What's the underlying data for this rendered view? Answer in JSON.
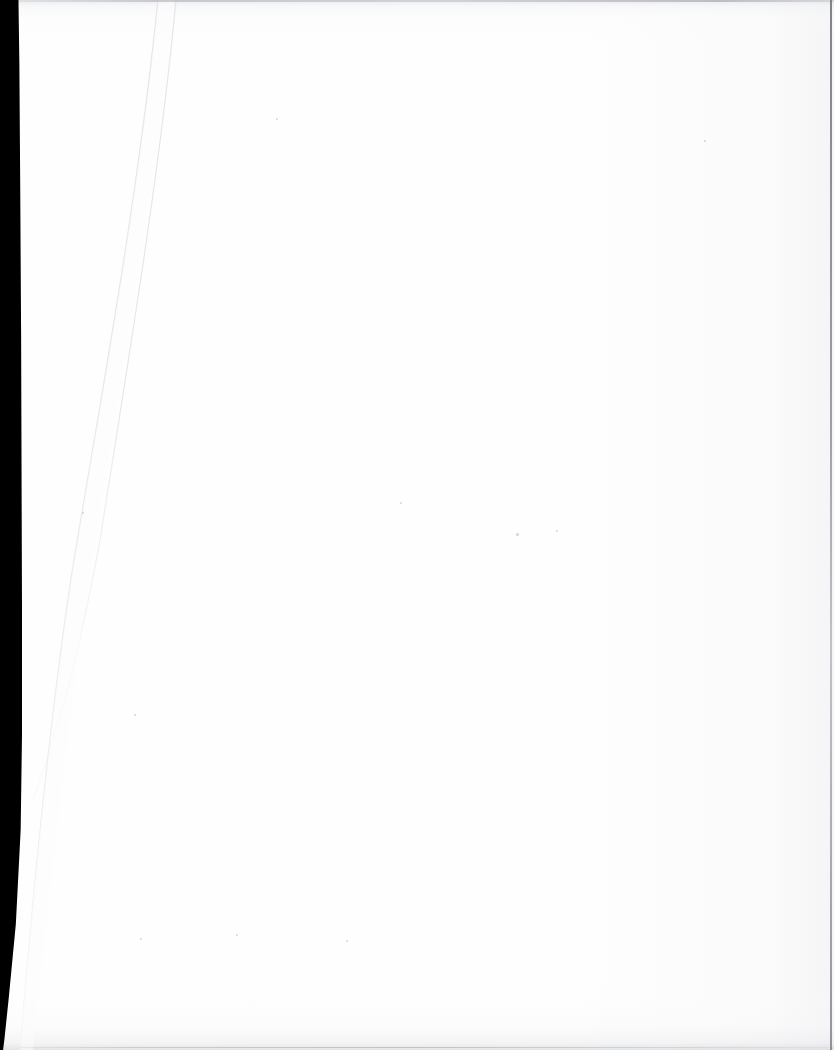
{
  "document": {
    "kind": "scanned-page",
    "title": "Blank scanned page",
    "page_width": 834,
    "page_height": 1050,
    "body_text": "",
    "text_content_present": false,
    "description": "A blank white scanned book/document page with a black scanner margin along the left edge and faint diagonal fold creases."
  },
  "colors": {
    "paper": "#fefefe",
    "scanner_margin": "#000000",
    "edge_rule": "#b2b4ba",
    "crease": "#e4e5e8",
    "bottom_smudge": "#ced0d4",
    "speck": "#b0b2b8"
  },
  "artifacts": {
    "scanner_margin": {
      "name": "black scanner margin",
      "side": "left",
      "width_top_px": 18,
      "width_mid_px": 21,
      "width_bottom_px": 3
    },
    "top_edge_rule": {
      "name": "top edge rule",
      "y_px": 0,
      "thickness_px": 2
    },
    "bottom_edge_rule": {
      "name": "bottom edge rule",
      "y_px": 1047,
      "thickness_px": 1
    },
    "right_edge_rule": {
      "name": "right edge rule",
      "x_px": 830,
      "thickness_px": 2
    },
    "bottom_smudge": {
      "name": "bottom shadow band",
      "height_px": 60
    },
    "top_shading": {
      "name": "top shading band",
      "height_px": 46
    },
    "creases": [
      {
        "name": "outer fold crease",
        "from": {
          "x": 158,
          "y": 0
        },
        "to": {
          "x": 20,
          "y": 1050
        }
      },
      {
        "name": "inner fold crease",
        "from": {
          "x": 176,
          "y": 0
        },
        "to": {
          "x": 33,
          "y": 800
        }
      }
    ],
    "specks": [
      {
        "x": 400,
        "y": 502,
        "size": 2
      },
      {
        "x": 556,
        "y": 530,
        "size": 2
      },
      {
        "x": 516,
        "y": 533,
        "size": 3
      },
      {
        "x": 82,
        "y": 512,
        "size": 2
      },
      {
        "x": 134,
        "y": 714,
        "size": 2
      },
      {
        "x": 236,
        "y": 934,
        "size": 2
      },
      {
        "x": 346,
        "y": 940,
        "size": 2
      },
      {
        "x": 140,
        "y": 938,
        "size": 2
      },
      {
        "x": 704,
        "y": 140,
        "size": 2
      },
      {
        "x": 276,
        "y": 118,
        "size": 2
      }
    ]
  }
}
